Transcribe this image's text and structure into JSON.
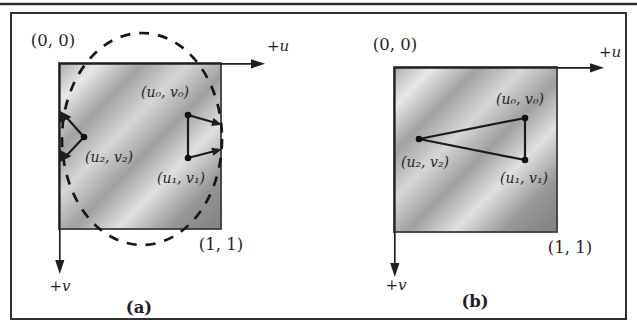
{
  "figure": {
    "colors": {
      "ink": "#1f1f1f",
      "frame_border": "#2f2f2f",
      "page_background": "#ffffff",
      "texture_stops": [
        "#ababab",
        "#e8e8e8",
        "#a2a2a2",
        "#d6d6d6",
        "#a0a0a0",
        "#e0e0e0",
        "#969696",
        "#808080"
      ]
    },
    "panels": [
      {
        "caption": "(a)",
        "origin_label": "(0, 0)",
        "far_corner_label": "(1, 1)",
        "u_axis_label": "+u",
        "v_axis_label": "+v",
        "vertex0_label": "(u₀, v₀)",
        "vertex1_label": "(u₁, v₁)",
        "vertex2_label": "(u₂, v₂)"
      },
      {
        "caption": "(b)",
        "origin_label": "(0, 0)",
        "far_corner_label": "(1, 1)",
        "u_axis_label": "+u",
        "v_axis_label": "+v",
        "vertex0_label": "(u₀, v₀)",
        "vertex1_label": "(u₁, v₁)",
        "vertex2_label": "(u₂, v₂)"
      }
    ]
  }
}
